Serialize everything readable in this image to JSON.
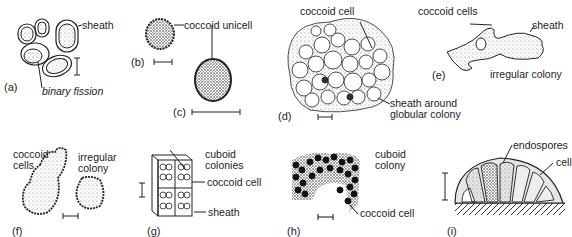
{
  "figure": {
    "panels": [
      {
        "id": "a",
        "tag": "(a)",
        "labels": [
          "sheath",
          "binary fission"
        ]
      },
      {
        "id": "b",
        "tag": "(b)",
        "labels": [
          "coccoid unicell"
        ]
      },
      {
        "id": "c",
        "tag": "(c)",
        "labels": []
      },
      {
        "id": "d",
        "tag": "(d)",
        "labels": [
          "coccoid cell",
          "sheath around",
          "globular colony"
        ]
      },
      {
        "id": "e",
        "tag": "(e)",
        "labels": [
          "coccoid cells",
          "sheath",
          "irregular colony"
        ]
      },
      {
        "id": "f",
        "tag": "(f)",
        "labels": [
          "coccoid",
          "cells",
          "irregular",
          "colony"
        ]
      },
      {
        "id": "g",
        "tag": "(g)",
        "labels": [
          "cuboid",
          "colonies",
          "coccoid cell",
          "sheath"
        ]
      },
      {
        "id": "h",
        "tag": "(h)",
        "labels": [
          "cuboid",
          "colony",
          "coccoid cell"
        ]
      },
      {
        "id": "i",
        "tag": "(i)",
        "labels": [
          "endospores",
          "cell"
        ]
      }
    ]
  }
}
